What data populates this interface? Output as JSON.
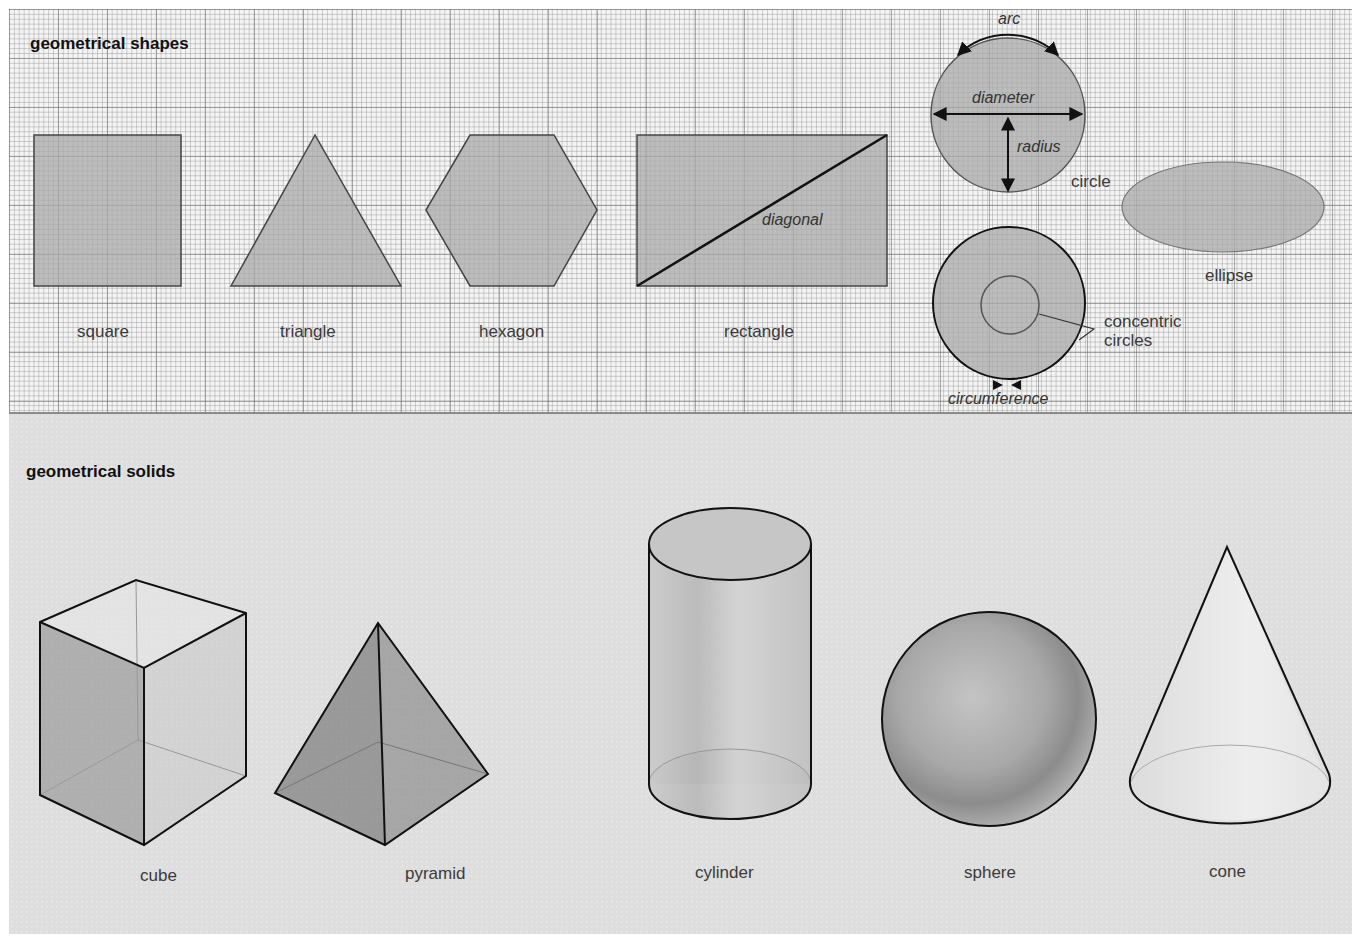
{
  "shapes_section": {
    "heading": "geometrical shapes",
    "items": [
      {
        "name": "square",
        "label": "square"
      },
      {
        "name": "triangle",
        "label": "triangle"
      },
      {
        "name": "hexagon",
        "label": "hexagon"
      },
      {
        "name": "rectangle",
        "label": "rectangle",
        "annotation": "diagonal"
      },
      {
        "name": "circle",
        "label": "circle",
        "annotations": [
          "arc",
          "diameter",
          "radius"
        ]
      },
      {
        "name": "ellipse",
        "label": "ellipse"
      },
      {
        "name": "concentric-circles",
        "label_line1": "concentric",
        "label_line2": "circles",
        "annotation": "circumference"
      }
    ]
  },
  "solids_section": {
    "heading": "geometrical solids",
    "items": [
      {
        "name": "cube",
        "label": "cube"
      },
      {
        "name": "pyramid",
        "label": "pyramid"
      },
      {
        "name": "cylinder",
        "label": "cylinder"
      },
      {
        "name": "sphere",
        "label": "sphere"
      },
      {
        "name": "cone",
        "label": "cone"
      }
    ]
  },
  "colors": {
    "shape_fill": "#a9a9a9",
    "outline": "#222222",
    "grid_bg": "#f4f4f4",
    "solids_bg": "#dedede"
  }
}
